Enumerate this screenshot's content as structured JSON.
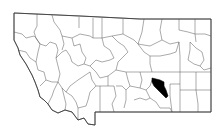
{
  "map": {
    "title": "Montana counties",
    "highlighted_county": "Treasure County",
    "colors": {
      "background": "#ffffff",
      "county_fill": "#ffffff",
      "county_border": "#4a4a4a",
      "highlight_fill": "#000000"
    }
  }
}
